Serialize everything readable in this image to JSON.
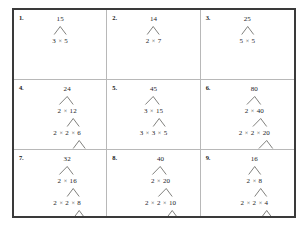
{
  "worksheet": {
    "title": "Factor Trees Worksheet",
    "columns": 3,
    "rows": 3,
    "operator": "×",
    "border_color": "#3a3a3a",
    "grid_line_color": "#b8b8b8",
    "text_color": "#23231f"
  },
  "problems": [
    {
      "number": "1.",
      "target": "15",
      "levels": [
        [
          "15"
        ],
        [
          "3",
          "5"
        ]
      ],
      "branches": [
        [
          {
            "from": 0,
            "to": 0
          },
          {
            "from": 0,
            "to": 1
          }
        ]
      ]
    },
    {
      "number": "2.",
      "target": "14",
      "levels": [
        [
          "14"
        ],
        [
          "2",
          "7"
        ]
      ],
      "branches": [
        [
          {
            "from": 0,
            "to": 0
          },
          {
            "from": 0,
            "to": 1
          }
        ]
      ]
    },
    {
      "number": "3.",
      "target": "25",
      "levels": [
        [
          "25"
        ],
        [
          "5",
          "5"
        ]
      ],
      "branches": [
        [
          {
            "from": 0,
            "to": 0
          },
          {
            "from": 0,
            "to": 1
          }
        ]
      ]
    },
    {
      "number": "4.",
      "target": "24",
      "levels": [
        [
          "24"
        ],
        [
          "2",
          "12"
        ],
        [
          "2",
          "2",
          "6"
        ],
        [
          "2",
          "2",
          "2",
          "2"
        ]
      ],
      "branches": [
        [
          {
            "from": 0,
            "to": 0
          },
          {
            "from": 0,
            "to": 1
          }
        ],
        [
          {
            "from": 1,
            "to": 1
          },
          {
            "from": 1,
            "to": 2
          }
        ],
        [
          {
            "from": 2,
            "to": 2
          },
          {
            "from": 2,
            "to": 3
          }
        ]
      ]
    },
    {
      "number": "5.",
      "target": "45",
      "levels": [
        [
          "45"
        ],
        [
          "3",
          "15"
        ],
        [
          "3",
          "3",
          "5"
        ]
      ],
      "branches": [
        [
          {
            "from": 0,
            "to": 0
          },
          {
            "from": 0,
            "to": 1
          }
        ],
        [
          {
            "from": 1,
            "to": 1
          },
          {
            "from": 1,
            "to": 2
          }
        ]
      ]
    },
    {
      "number": "6.",
      "target": "80",
      "levels": [
        [
          "80"
        ],
        [
          "2",
          "40"
        ],
        [
          "2",
          "2",
          "20"
        ],
        [
          "2",
          "2",
          "2",
          "10"
        ],
        [
          "2",
          "2",
          "2",
          "2",
          "5"
        ]
      ],
      "branches": [
        [
          {
            "from": 0,
            "to": 0
          },
          {
            "from": 0,
            "to": 1
          }
        ],
        [
          {
            "from": 1,
            "to": 1
          },
          {
            "from": 1,
            "to": 2
          }
        ],
        [
          {
            "from": 2,
            "to": 2
          },
          {
            "from": 2,
            "to": 3
          }
        ],
        [
          {
            "from": 3,
            "to": 3
          },
          {
            "from": 3,
            "to": 4
          }
        ]
      ]
    },
    {
      "number": "7.",
      "target": "32",
      "levels": [
        [
          "32"
        ],
        [
          "2",
          "16"
        ],
        [
          "2",
          "2",
          "8"
        ],
        [
          "2",
          "2",
          "2",
          "4"
        ],
        [
          "2",
          "2",
          "2",
          "2",
          "2"
        ]
      ],
      "branches": [
        [
          {
            "from": 0,
            "to": 0
          },
          {
            "from": 0,
            "to": 1
          }
        ],
        [
          {
            "from": 1,
            "to": 1
          },
          {
            "from": 1,
            "to": 2
          }
        ],
        [
          {
            "from": 2,
            "to": 2
          },
          {
            "from": 2,
            "to": 3
          }
        ],
        [
          {
            "from": 3,
            "to": 3
          },
          {
            "from": 3,
            "to": 4
          }
        ]
      ]
    },
    {
      "number": "8.",
      "target": "40",
      "levels": [
        [
          "40"
        ],
        [
          "2",
          "20"
        ],
        [
          "2",
          "2",
          "10"
        ],
        [
          "2",
          "2",
          "2",
          "5"
        ]
      ],
      "branches": [
        [
          {
            "from": 0,
            "to": 0
          },
          {
            "from": 0,
            "to": 1
          }
        ],
        [
          {
            "from": 1,
            "to": 1
          },
          {
            "from": 1,
            "to": 2
          }
        ],
        [
          {
            "from": 2,
            "to": 2
          },
          {
            "from": 2,
            "to": 3
          }
        ]
      ]
    },
    {
      "number": "9.",
      "target": "16",
      "levels": [
        [
          "16"
        ],
        [
          "2",
          "8"
        ],
        [
          "2",
          "2",
          "4"
        ],
        [
          "2",
          "2",
          "2",
          "2"
        ]
      ],
      "branches": [
        [
          {
            "from": 0,
            "to": 0
          },
          {
            "from": 0,
            "to": 1
          }
        ],
        [
          {
            "from": 1,
            "to": 1
          },
          {
            "from": 1,
            "to": 2
          }
        ],
        [
          {
            "from": 2,
            "to": 2
          },
          {
            "from": 2,
            "to": 3
          }
        ]
      ]
    }
  ]
}
